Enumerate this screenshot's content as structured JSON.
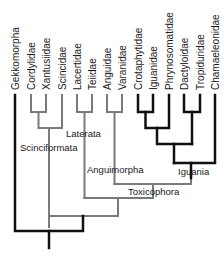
{
  "diagram": {
    "type": "phylogenetic-tree",
    "taxa": [
      {
        "name": "Gekkomorpha",
        "x": 15
      },
      {
        "name": "Cordylidae",
        "x": 31
      },
      {
        "name": "Xantusiidae",
        "x": 46
      },
      {
        "name": "Scincidae",
        "x": 62
      },
      {
        "name": "Lacertidae",
        "x": 77
      },
      {
        "name": "Teiidae",
        "x": 92
      },
      {
        "name": "Anguidae",
        "x": 107
      },
      {
        "name": "Varanidae",
        "x": 122
      },
      {
        "name": "Crotaphytidae",
        "x": 138
      },
      {
        "name": "Iguanidae",
        "x": 153
      },
      {
        "name": "Phrynosomatidae",
        "x": 169
      },
      {
        "name": "Dactyloidae",
        "x": 184
      },
      {
        "name": "Tropiduridae",
        "x": 200
      },
      {
        "name": "Chamaeleonidae",
        "x": 215
      }
    ],
    "clade_labels": {
      "scinciformata": "Scinciformata",
      "laterata": "Laterata",
      "anguimorpha": "Anguimorpha",
      "iguania": "Iguania",
      "toxicophora": "Toxicophora"
    },
    "colors": {
      "gray_branch": "#7a7a7a",
      "black_branch": "#111111",
      "text": "#1a1a1a"
    }
  }
}
